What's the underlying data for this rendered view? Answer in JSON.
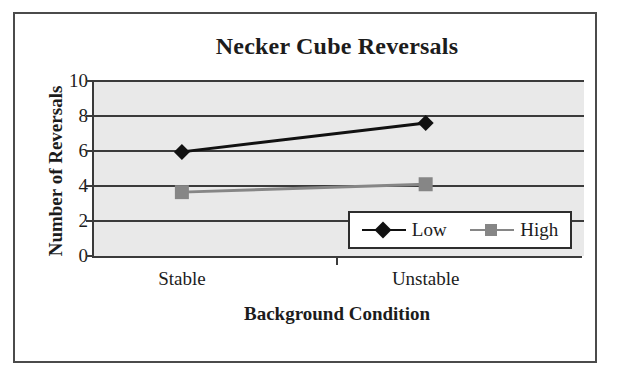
{
  "chart_data": {
    "type": "line",
    "title": "Necker Cube Reversals",
    "xlabel": "Background Condition",
    "ylabel": "Number of Reversals",
    "categories": [
      "Stable",
      "Unstable"
    ],
    "series": [
      {
        "name": "Low",
        "values": [
          5.95,
          7.6
        ],
        "color": "#111111",
        "marker": "diamond"
      },
      {
        "name": "High",
        "values": [
          3.65,
          4.1
        ],
        "color": "#868686",
        "marker": "square"
      }
    ],
    "ylim": [
      0,
      10
    ],
    "yticks": [
      0,
      2,
      4,
      6,
      8,
      10
    ],
    "ytick_labels": [
      "0",
      "2",
      "4",
      "6",
      "8",
      "10"
    ],
    "grid": true,
    "grid_axis": "y",
    "legend_position": "inside-bottom-right",
    "plot_background": "#e9e9e9",
    "figure_background": "#ffffff"
  },
  "legend": {
    "entries": [
      {
        "label": "Low"
      },
      {
        "label": "High"
      }
    ]
  },
  "icons": {
    "diamond_marker": "diamond-marker-icon",
    "square_marker": "square-marker-icon"
  }
}
